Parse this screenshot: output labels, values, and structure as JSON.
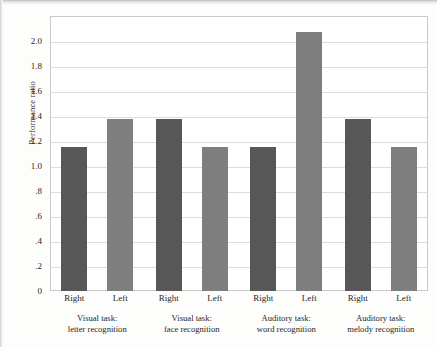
{
  "chart_data": {
    "type": "bar",
    "title": "",
    "subtitle": "",
    "xlabel": "",
    "ylabel": "Performance ratio",
    "ylim": [
      0,
      2.2
    ],
    "grid": "horizontal",
    "legend_position": "none",
    "categories": [
      "Visual task: letter recognition",
      "Visual task: face recognition",
      "Auditory task: word recognition",
      "Auditory task: melody recognition"
    ],
    "category_lines": [
      [
        "Visual task:",
        "letter recognition"
      ],
      [
        "Visual task:",
        "face recognition"
      ],
      [
        "Auditory task:",
        "word recognition"
      ],
      [
        "Auditory task:",
        "melody recognition"
      ]
    ],
    "series": [
      {
        "name": "Right",
        "color": "#575757",
        "values": [
          1.15,
          1.38,
          1.15,
          1.38
        ]
      },
      {
        "name": "Left",
        "color": "#7e7e7e",
        "values": [
          1.38,
          1.15,
          2.07,
          1.15
        ]
      }
    ],
    "ytick_labels": [
      "0",
      ".2",
      ".4",
      ".6",
      ".8",
      "1.0",
      "1.2",
      "1.4",
      "1.6",
      "1.8",
      "2.0"
    ],
    "ytick_values": [
      0,
      0.2,
      0.4,
      0.6,
      0.8,
      1.0,
      1.2,
      1.4,
      1.6,
      1.8,
      2.0
    ],
    "bar_labels": [
      "Right",
      "Left",
      "Right",
      "Left",
      "Right",
      "Left",
      "Right",
      "Left"
    ],
    "colors": {
      "right_bar": "#575757",
      "left_bar": "#7e7e7e",
      "gridline": "#dcdcdc",
      "frame": "#c9c9c9",
      "plot_background": "#ffffff",
      "page_background": "#fdfdfc",
      "text": "#262626"
    }
  }
}
